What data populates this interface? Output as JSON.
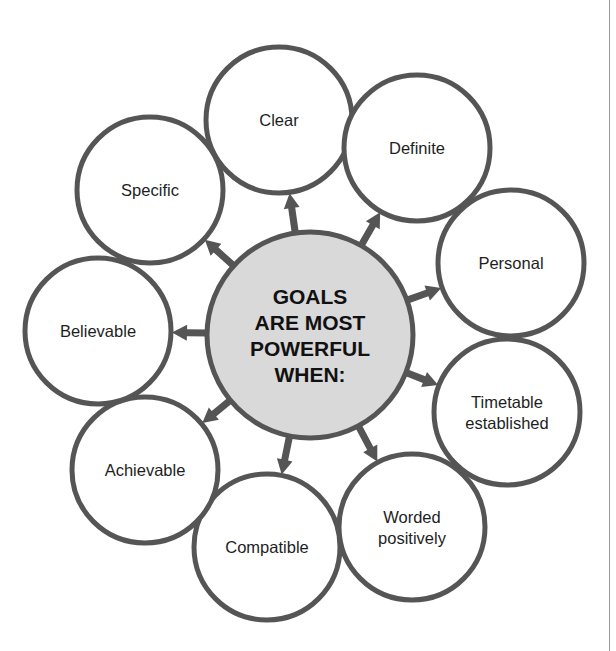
{
  "diagram": {
    "center": {
      "lines": [
        "GOALS",
        "ARE MOST",
        "POWERFUL",
        "WHEN:"
      ],
      "cx": 310,
      "cy": 335,
      "r": 103
    },
    "nodes": [
      {
        "label": [
          "Clear"
        ],
        "cx": 279,
        "cy": 120,
        "r": 73
      },
      {
        "label": [
          "Definite"
        ],
        "cx": 417,
        "cy": 148,
        "r": 73
      },
      {
        "label": [
          "Personal"
        ],
        "cx": 511,
        "cy": 263,
        "r": 73
      },
      {
        "label": [
          "Timetable",
          "established"
        ],
        "cx": 507,
        "cy": 412,
        "r": 73
      },
      {
        "label": [
          "Worded",
          "positively"
        ],
        "cx": 412,
        "cy": 527,
        "r": 73
      },
      {
        "label": [
          "Compatible"
        ],
        "cx": 267,
        "cy": 547,
        "r": 73
      },
      {
        "label": [
          "Achievable"
        ],
        "cx": 145,
        "cy": 470,
        "r": 73
      },
      {
        "label": [
          "Believable"
        ],
        "cx": 98,
        "cy": 331,
        "r": 73
      },
      {
        "label": [
          "Specific"
        ],
        "cx": 150,
        "cy": 190,
        "r": 73
      }
    ],
    "colors": {
      "stroke": "#555555",
      "center_fill": "#d9d9d9",
      "node_fill": "#ffffff",
      "arrow": "#555555",
      "text": "#1e1e1e"
    }
  }
}
